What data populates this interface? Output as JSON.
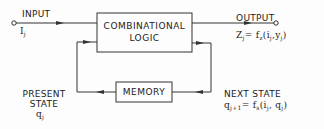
{
  "diagram": {
    "input_label": "INPUT",
    "input_symbol": "I",
    "input_sub": "j",
    "output_label": "OUTPUT",
    "output_eq": {
      "lhs": "Z",
      "lhs_sub": "j",
      "rhs": "= f",
      "rhs_sub": "z",
      "args": "(i",
      "args_sub1": "j",
      "args_mid": ",y",
      "args_sub2": "j",
      "args_end": ")"
    },
    "combinational_line1": "COMBINATIONAL",
    "combinational_line2": "LOGIC",
    "memory_label": "MEMORY",
    "present_state_line1": "PRESENT",
    "present_state_line2": "STATE",
    "present_state_symbol": "q",
    "present_state_sub": "j",
    "next_state_label": "NEXT STATE",
    "next_state_eq": {
      "lhs": "q",
      "lhs_sub": "j+1",
      "rhs": "= f",
      "rhs_sub": "s",
      "args": "(i",
      "args_sub1": "j",
      "args_mid": ", q",
      "args_sub2": "j",
      "args_end": ")"
    },
    "line_color": "#333333"
  }
}
